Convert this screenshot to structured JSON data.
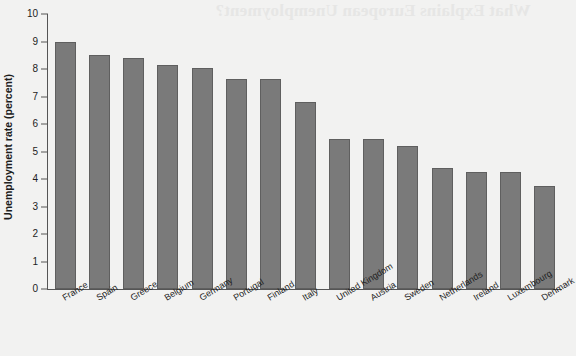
{
  "page": {
    "bleed_through_text": "What Explains European Unemployment?"
  },
  "chart_data": {
    "type": "bar",
    "title": "",
    "xlabel": "",
    "ylabel": "Unemployment rate (percent)",
    "ylim": [
      0,
      10
    ],
    "ytick_labels": [
      "10",
      "9",
      "8",
      "7",
      "6",
      "5",
      "4",
      "3",
      "2",
      "1",
      "0"
    ],
    "yticks": [
      10,
      9,
      8,
      7,
      6,
      5,
      4,
      3,
      2,
      1,
      0
    ],
    "grid": false,
    "legend": "none",
    "bar_color": "#7a7a7a",
    "bar_edge_color": "#5f5f5f",
    "background_color": "#f2f2f1",
    "categories": [
      "France",
      "Spain",
      "Greece",
      "Belgium",
      "Germany",
      "Portugal",
      "Finland",
      "Italy",
      "United Kingdom",
      "Austria",
      "Sweden",
      "Netherlands",
      "Ireland",
      "Luxembourg",
      "Denmark"
    ],
    "values": [
      9.0,
      8.5,
      8.4,
      8.15,
      8.05,
      7.65,
      7.65,
      6.8,
      5.45,
      5.45,
      5.2,
      4.4,
      4.25,
      4.25,
      3.75
    ]
  }
}
